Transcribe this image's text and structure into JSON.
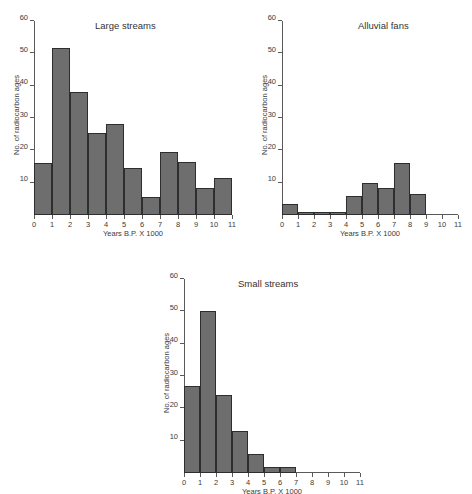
{
  "figure": {
    "background": "#ffffff",
    "bar_fill": "#6e6e6e",
    "bar_stroke": "#2e2e2e",
    "axis_color": "#5a5a5a",
    "text_color": "#333333"
  },
  "chart_data": [
    {
      "type": "bar",
      "id": "large-streams",
      "title": "Large streams",
      "xlabel": "Years B.P. X 1000",
      "ylabel": "No. of radiocarbon ages",
      "xlim": [
        0,
        11
      ],
      "ylim": [
        0,
        60
      ],
      "xticks": [
        "0",
        "1",
        "2",
        "3",
        "4",
        "5",
        "6",
        "7",
        "8",
        "9",
        "10",
        "11"
      ],
      "yticks": [
        "10",
        "20",
        "30",
        "40",
        "50",
        "60"
      ],
      "grid": false,
      "legend": "none",
      "bin_edges": [
        0,
        1,
        2,
        3,
        4,
        5,
        6,
        7,
        8,
        9,
        10,
        11
      ],
      "categories": [
        "0-1",
        "1-2",
        "2-3",
        "3-4",
        "4-5",
        "5-6",
        "6-7",
        "7-8",
        "8-9",
        "9-10",
        "10-11"
      ],
      "values": [
        16,
        51.5,
        38,
        25.5,
        28,
        14.5,
        5.5,
        19.5,
        16.5,
        8.5,
        11.5
      ]
    },
    {
      "type": "bar",
      "id": "alluvial-fans",
      "title": "Alluvial fans",
      "xlabel": "Years B.P. X 1000",
      "ylabel": "No. of radiocarbon ages",
      "xlim": [
        0,
        11
      ],
      "ylim": [
        0,
        60
      ],
      "xticks": [
        "0",
        "1",
        "2",
        "3",
        "4",
        "5",
        "6",
        "7",
        "8",
        "9",
        "10",
        "11"
      ],
      "yticks": [
        "10",
        "20",
        "30",
        "40",
        "50",
        "60"
      ],
      "grid": false,
      "legend": "none",
      "bin_edges": [
        0,
        1,
        2,
        3,
        4,
        5,
        6,
        7,
        8,
        9
      ],
      "categories": [
        "0-1",
        "1-2",
        "2-3",
        "3-4",
        "4-5",
        "5-6",
        "6-7",
        "7-8",
        "8-9"
      ],
      "values": [
        3.5,
        1,
        1,
        1,
        6,
        10,
        8.5,
        16,
        6.5
      ]
    },
    {
      "type": "bar",
      "id": "small-streams",
      "title": "Small streams",
      "xlabel": "Years B.P. X 1000",
      "ylabel": "No. of radiocarbon ages",
      "xlim": [
        0,
        11
      ],
      "ylim": [
        0,
        60
      ],
      "xticks": [
        "0",
        "1",
        "2",
        "3",
        "4",
        "5",
        "6",
        "7",
        "8",
        "9",
        "10",
        "11"
      ],
      "yticks": [
        "10",
        "20",
        "30",
        "40",
        "50",
        "60"
      ],
      "grid": false,
      "legend": "none",
      "bin_edges": [
        0,
        1,
        2,
        3,
        4,
        5,
        6,
        7
      ],
      "categories": [
        "0-1",
        "1-2",
        "2-3",
        "3-4",
        "4-5",
        "5-6",
        "6-7"
      ],
      "values": [
        27,
        50,
        24,
        13,
        6,
        2,
        2
      ]
    }
  ]
}
